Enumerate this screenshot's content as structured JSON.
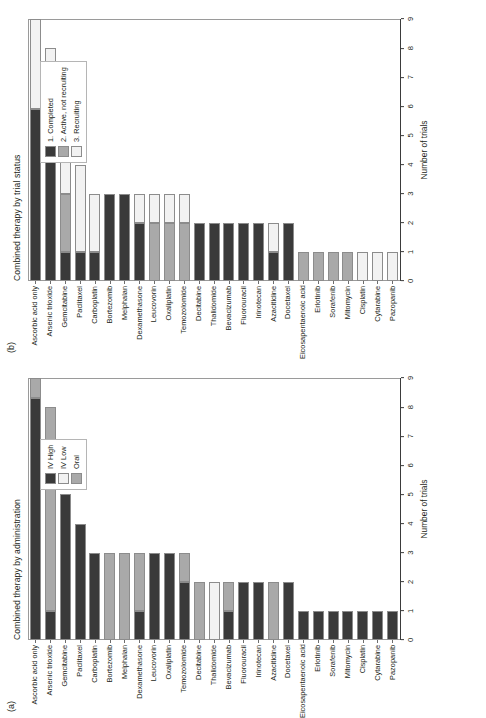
{
  "figure": {
    "categories": [
      "Ascorbic acid only",
      "Arsenic trioxide",
      "Gemcitabine",
      "Paclitaxel",
      "Carboplatin",
      "Bortezomib",
      "Melphalan",
      "Dexamethasone",
      "Leucovorin",
      "Oxaliplatin",
      "Temozolomide",
      "Decitabine",
      "Thalidomide",
      "Bevacizumab",
      "Fluorouracil",
      "Irinotecan",
      "Azacitidine",
      "Docetaxel",
      "Eicosapentaenoic acid",
      "Erlotinib",
      "Sorafenib",
      "Mitomycin",
      "Cisplatin",
      "Cytarabine",
      "Pazopanib"
    ],
    "xticks": [
      "0",
      "1",
      "2",
      "3",
      "4",
      "5",
      "6",
      "7",
      "8",
      "9"
    ],
    "xlabel": "Number of trials",
    "colors": {
      "dark": "#3a3a3a",
      "mid": "#a9a9a9",
      "light": "#f2f2f2"
    }
  },
  "panel_a": {
    "tag": "(a)",
    "title": "Combined therapy by administration",
    "legend": [
      {
        "label": "IV High",
        "color": "#3a3a3a"
      },
      {
        "label": "IV Low",
        "color": "#f2f2f2"
      },
      {
        "label": "Oral",
        "color": "#a9a9a9"
      }
    ]
  },
  "panel_b": {
    "tag": "(b)",
    "title": "Combined therapy by trial status",
    "legend": [
      {
        "label": "1. Completed",
        "color": "#3a3a3a"
      },
      {
        "label": "2. Active, not recruiting",
        "color": "#a9a9a9"
      },
      {
        "label": "3. Recruiting",
        "color": "#f2f2f2"
      }
    ]
  },
  "chart_data": [
    {
      "type": "bar",
      "orientation": "horizontal",
      "stacked": true,
      "panel": "(a)",
      "title": "Combined therapy by administration",
      "xlabel": "Number of trials",
      "ylabel": "",
      "xlim": [
        0,
        9
      ],
      "grid": false,
      "legend_position": "right",
      "categories": [
        "Ascorbic acid only",
        "Arsenic trioxide",
        "Gemcitabine",
        "Paclitaxel",
        "Carboplatin",
        "Bortezomib",
        "Melphalan",
        "Dexamethasone",
        "Leucovorin",
        "Oxaliplatin",
        "Temozolomide",
        "Decitabine",
        "Thalidomide",
        "Bevacizumab",
        "Fluorouracil",
        "Irinotecan",
        "Azacitidine",
        "Docetaxel",
        "Eicosapentaenoic acid",
        "Erlotinib",
        "Sorafenib",
        "Mitomycin",
        "Cisplatin",
        "Cytarabine",
        "Pazopanib"
      ],
      "series": [
        {
          "name": "IV High",
          "color": "#3a3a3a",
          "values": [
            8.3,
            1,
            5,
            4,
            3,
            0,
            0,
            1,
            3,
            3,
            2,
            0,
            0,
            1,
            2,
            2,
            0,
            2,
            1,
            1,
            1,
            1,
            1,
            1,
            1
          ]
        },
        {
          "name": "IV Low",
          "color": "#f2f2f2",
          "values": [
            0,
            0,
            0,
            0,
            0,
            0,
            0,
            0,
            0,
            0,
            0,
            0,
            2,
            0,
            0,
            0,
            0,
            0,
            0,
            0,
            0,
            0,
            0,
            0,
            0
          ]
        },
        {
          "name": "Oral",
          "color": "#a9a9a9",
          "values": [
            0.7,
            7,
            0,
            0,
            0,
            3,
            3,
            2,
            0,
            0,
            1,
            2,
            0,
            1,
            0,
            0,
            2,
            0,
            0,
            0,
            0,
            0,
            0,
            0,
            0
          ]
        }
      ],
      "totals": [
        9,
        8,
        5,
        4,
        3,
        3,
        3,
        3,
        3,
        3,
        3,
        2,
        2,
        2,
        2,
        2,
        2,
        2,
        1,
        1,
        1,
        1,
        1,
        1,
        1
      ]
    },
    {
      "type": "bar",
      "orientation": "horizontal",
      "stacked": true,
      "panel": "(b)",
      "title": "Combined therapy by trial status",
      "xlabel": "Number of trials",
      "ylabel": "",
      "xlim": [
        0,
        9
      ],
      "grid": false,
      "legend_position": "right",
      "categories": [
        "Ascorbic acid only",
        "Arsenic trioxide",
        "Gemcitabine",
        "Paclitaxel",
        "Carboplatin",
        "Bortezomib",
        "Melphalan",
        "Dexamethasone",
        "Leucovorin",
        "Oxaliplatin",
        "Temozolomide",
        "Decitabine",
        "Thalidomide",
        "Bevacizumab",
        "Fluorouracil",
        "Irinotecan",
        "Azacitidine",
        "Docetaxel",
        "Eicosapentaenoic acid",
        "Erlotinib",
        "Sorafenib",
        "Mitomycin",
        "Cisplatin",
        "Cytarabine",
        "Pazopanib"
      ],
      "series": [
        {
          "name": "1. Completed",
          "color": "#3a3a3a",
          "values": [
            5.9,
            7,
            1,
            1,
            1,
            3,
            3,
            2,
            0,
            0,
            0,
            2,
            2,
            2,
            2,
            2,
            1,
            2,
            0,
            0,
            0,
            0,
            0,
            0,
            0
          ]
        },
        {
          "name": "2. Active, not recruiting",
          "color": "#a9a9a9",
          "values": [
            0,
            0,
            2,
            0,
            0,
            0,
            0,
            0,
            2,
            2,
            2,
            0,
            0,
            0,
            0,
            0,
            0,
            0,
            1,
            1,
            1,
            1,
            0,
            0,
            0
          ]
        },
        {
          "name": "3. Recruiting",
          "color": "#f2f2f2",
          "values": [
            3.1,
            1,
            2,
            3,
            2,
            0,
            0,
            1,
            1,
            1,
            1,
            0,
            0,
            0,
            0,
            0,
            1,
            0,
            0,
            0,
            0,
            0,
            1,
            1,
            1
          ]
        }
      ],
      "totals": [
        9,
        8,
        5,
        4,
        3,
        3,
        3,
        3,
        3,
        3,
        3,
        2,
        2,
        2,
        2,
        2,
        2,
        2,
        1,
        1,
        1,
        1,
        1,
        1,
        1
      ]
    }
  ]
}
